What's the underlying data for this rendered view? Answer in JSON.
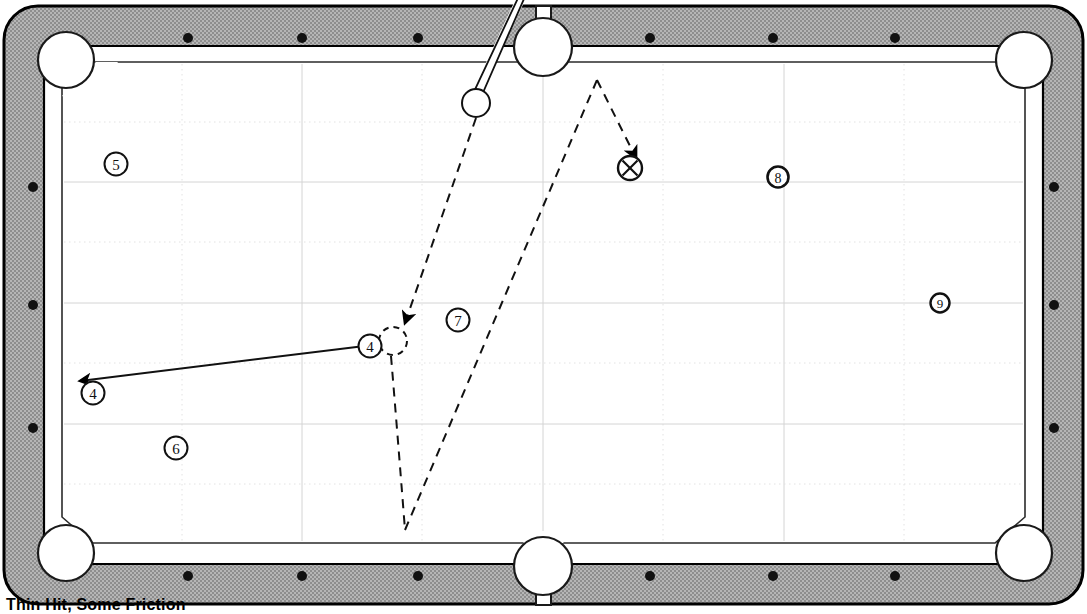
{
  "figure": {
    "caption": "Thin Hit, Some Friction",
    "kind": "pool-table-shot-diagram"
  },
  "colors": {
    "rail": "#a8a8a8",
    "rail_outline": "#000000",
    "cloth": "#ffffff",
    "grid_line": "#d9d9d9",
    "grid_line_faint": "#e6e6e6",
    "ink": "#000000",
    "pocket_fill": "#ffffff",
    "diamond": "#111111"
  },
  "table": {
    "outer": {
      "x": 4,
      "y": 6,
      "width": 1079,
      "height": 598
    },
    "cloth": {
      "x": 62,
      "y": 62,
      "width": 963,
      "height": 481
    },
    "rail_thickness": 40,
    "corner_radius": 34
  },
  "diamonds": {
    "top_count": 6,
    "bottom_count": 6,
    "left_count": 3,
    "right_count": 3,
    "top": [
      188,
      302,
      418,
      650,
      773,
      895
    ],
    "bottom": [
      188,
      302,
      418,
      650,
      773,
      895
    ],
    "left": [
      187,
      305,
      428
    ],
    "right": [
      187,
      305,
      428
    ]
  },
  "pockets": [
    {
      "name": "top-left-corner",
      "cx": 66,
      "cy": 60,
      "r": 28
    },
    {
      "name": "top-side",
      "cx": 543,
      "cy": 47,
      "r": 29
    },
    {
      "name": "top-right-corner",
      "cx": 1024,
      "cy": 60,
      "r": 28
    },
    {
      "name": "bottom-left-corner",
      "cx": 66,
      "cy": 553,
      "r": 28
    },
    {
      "name": "bottom-side",
      "cx": 543,
      "cy": 566,
      "r": 29
    },
    {
      "name": "bottom-right-corner",
      "cx": 1024,
      "cy": 553,
      "r": 28
    }
  ],
  "balls": [
    {
      "label": "5",
      "name": "ball-marker-5",
      "cx": 116,
      "cy": 164,
      "r": 11,
      "style": "outline"
    },
    {
      "label": "8",
      "name": "ball-marker-8",
      "cx": 778,
      "cy": 177,
      "r": 10,
      "style": "outline"
    },
    {
      "label": "9",
      "name": "ball-marker-9",
      "cx": 940,
      "cy": 303,
      "r": 9,
      "style": "outline"
    },
    {
      "label": "7",
      "name": "ball-marker-7",
      "cx": 458,
      "cy": 320,
      "r": 11,
      "style": "outline"
    },
    {
      "label": "6",
      "name": "ball-marker-6",
      "cx": 176,
      "cy": 448,
      "r": 11,
      "style": "outline"
    },
    {
      "label": "4",
      "name": "ball-object-4-start",
      "cx": 370,
      "cy": 346,
      "r": 11,
      "style": "outline"
    },
    {
      "label": "4",
      "name": "ball-object-4-end",
      "cx": 93,
      "cy": 393,
      "r": 11,
      "style": "outline"
    }
  ],
  "cue_ball": {
    "name": "cue-ball",
    "cx": 476,
    "cy": 103,
    "r": 14
  },
  "ghost_ball": {
    "name": "ghost-ball",
    "cx": 393,
    "cy": 341,
    "r": 14,
    "stroke": "dashed"
  },
  "target_marker": {
    "name": "target-x-marker",
    "label": "X",
    "cx": 630,
    "cy": 168,
    "r": 12
  },
  "cue_stick": {
    "name": "cue-stick",
    "tip": {
      "x": 471,
      "y": 97
    },
    "butt": {
      "x": 523,
      "y": 0
    },
    "width": 7
  },
  "paths": [
    {
      "name": "cue-ball-to-ghost-path",
      "style": "dashed",
      "points": [
        [
          476,
          117
        ],
        [
          407,
          326
        ]
      ],
      "arrow_at_end": true
    },
    {
      "name": "cue-ball-after-contact-path",
      "style": "dashed",
      "points": [
        [
          391,
          356
        ],
        [
          405,
          530
        ]
      ],
      "arrow_at_end": false
    },
    {
      "name": "cue-ball-rebound-path",
      "style": "dashed",
      "points": [
        [
          405,
          530
        ],
        [
          597,
          80
        ],
        [
          637,
          160
        ]
      ],
      "arrow_at_end": true
    },
    {
      "name": "object-ball-4-path",
      "style": "solid",
      "points": [
        [
          380,
          344
        ],
        [
          78,
          382
        ]
      ],
      "arrow_at_end": true
    }
  ],
  "grid": {
    "vertical_solid": [
      302,
      543,
      784
    ],
    "vertical_dotted": [
      182,
      422,
      663,
      904
    ],
    "horizontal_solid": [
      182,
      303,
      424
    ],
    "horizontal_dotted": [
      122,
      242,
      363,
      484
    ]
  }
}
